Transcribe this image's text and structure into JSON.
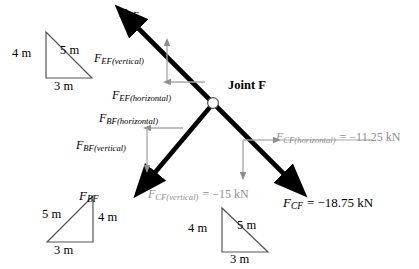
{
  "figure": {
    "type": "free-body-diagram",
    "joint": {
      "label": "Joint F",
      "x": 213,
      "y": 103
    },
    "colors": {
      "member_force": "#000000",
      "component_arrow": "#8d8d8d",
      "component_text": "#000000",
      "value_text": "#8d8d8d",
      "triangle_stroke": "#555555",
      "background": "#ffffff"
    },
    "member_forces": [
      {
        "name": "F_EF",
        "symbol": "F",
        "subscript": "EF",
        "label": "F",
        "direction": "up-left",
        "from": [
          213,
          103
        ],
        "to": [
          132,
          22
        ]
      },
      {
        "name": "F_BF",
        "symbol": "F",
        "subscript": "BF",
        "label": "F",
        "direction": "down-left",
        "from": [
          213,
          103
        ],
        "to": [
          148,
          180
        ]
      },
      {
        "name": "F_CF",
        "symbol": "F",
        "subscript": "CF",
        "label": "F",
        "direction": "down-right",
        "from": [
          213,
          103
        ],
        "to": [
          290,
          180
        ],
        "value": "= −18.75 kN"
      }
    ],
    "components": [
      {
        "name": "F_EF(vertical)",
        "symbol": "F",
        "subscript": "EF(vertical)",
        "orientation": "vertical",
        "arrow_direction": "up"
      },
      {
        "name": "F_EF(horizontal)",
        "symbol": "F",
        "subscript": "EF(horizontal)",
        "orientation": "horizontal",
        "arrow_direction": "left"
      },
      {
        "name": "F_BF(horizontal)",
        "symbol": "F",
        "subscript": "BF(horizontal)",
        "orientation": "horizontal",
        "arrow_direction": "left"
      },
      {
        "name": "F_BF(vertical)",
        "symbol": "F",
        "subscript": "BF(vertical)",
        "orientation": "vertical",
        "arrow_direction": "down"
      },
      {
        "name": "F_CF(horizontal)",
        "symbol": "F",
        "subscript": "CF(horizontal)",
        "orientation": "horizontal",
        "arrow_direction": "right",
        "value": "= −11.25 kN"
      },
      {
        "name": "F_CF(vertical)",
        "symbol": "F",
        "subscript": "CF(vertical)",
        "orientation": "vertical",
        "arrow_direction": "down",
        "value": "= −15 kN"
      }
    ],
    "triangles": [
      {
        "name": "triangle-ef",
        "position": "top-left",
        "vertical": "4 m",
        "hypotenuse": "5 m",
        "base": "3 m",
        "orientation": "right-angle-bottom-left"
      },
      {
        "name": "triangle-bf",
        "position": "bottom-left",
        "vertical": "4 m",
        "hypotenuse": "5 m",
        "base": "3 m",
        "orientation": "right-angle-bottom-right"
      },
      {
        "name": "triangle-cf",
        "position": "bottom-center",
        "vertical": "4 m",
        "hypotenuse": "5 m",
        "base": "3 m",
        "orientation": "right-angle-bottom-left"
      }
    ]
  }
}
